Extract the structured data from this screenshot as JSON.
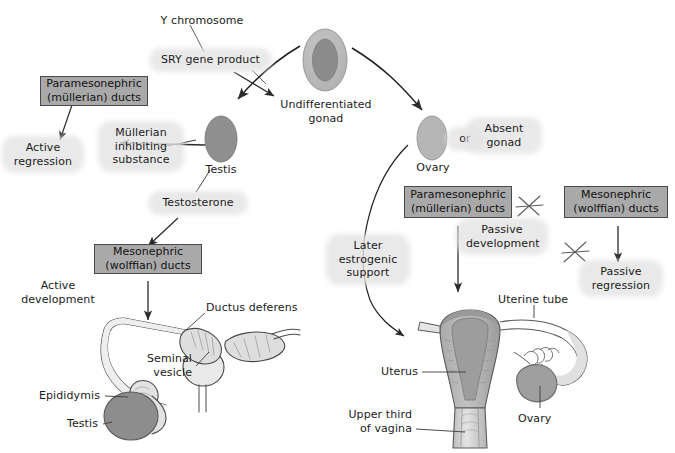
{
  "figure": {
    "background": "#ffffff",
    "width": 675,
    "height": 453
  },
  "colors": {
    "duct_box_fill": "#a9a9a9",
    "duct_box_border": "#4a4a4a",
    "label_halo": "#e4e4e4",
    "text": "#1b1b1b",
    "gonad_outer": "#b9b9b9",
    "gonad_inner": "#8a8a8a",
    "testis_fill": "#8f8f8f",
    "ovary_fill": "#b5b5b5",
    "arrow_stroke": "#2b2b2b",
    "anatomy_light": "#e8e8e8",
    "anatomy_mid": "#c9c9c9",
    "anatomy_dark": "#909090",
    "leader_line": "#3a3a3a"
  },
  "pathway": {
    "male": {
      "trigger": "Y chromosome",
      "signal": "SRY gene product",
      "gonad": "Testis",
      "hormones": [
        {
          "name": "Müllerian\ninhibiting\nsubstance",
          "effect": "Active\nregression",
          "target": "Paramesonephric\n(müllerian) ducts"
        },
        {
          "name": "Testosterone",
          "effect": "Active\ndevelopment",
          "target": "Mesonephric\n(wolffian) ducts"
        }
      ]
    },
    "common": {
      "gonad": "Undifferentiated\ngonad"
    },
    "female": {
      "gonad": "Ovary",
      "alternative_connector": "or",
      "alternative": "Absent\ngonad",
      "support": "Later\nestrogenic\nsupport",
      "outcomes": [
        {
          "target": "Paramesonephric\n(müllerian) ducts",
          "effect": "Passive\ndevelopment",
          "blocked": false
        },
        {
          "target": "Mesonephric\n(wolffian) ducts",
          "effect": "Passive\nregression",
          "blocked": true
        }
      ]
    }
  },
  "boxes": {
    "male_paramesonephric": "Paramesonephric\n(müllerian) ducts",
    "male_mesonephric": "Mesonephric\n(wolffian) ducts",
    "female_paramesonephric": "Paramesonephric\n(müllerian) ducts",
    "female_mesonephric": "Mesonephric\n(wolffian) ducts"
  },
  "labels": {
    "y_chromosome": "Y chromosome",
    "sry_gene_product": "SRY gene product",
    "undifferentiated_gonad": "Undifferentiated\ngonad",
    "mullerian_inhibiting_substance": "Müllerian\ninhibiting\nsubstance",
    "active_regression": "Active\nregression",
    "testis_node": "Testis",
    "testosterone": "Testosterone",
    "active_development": "Active\ndevelopment",
    "ovary_node": "Ovary",
    "or": "or",
    "absent_gonad": "Absent\ngonad",
    "later_estrogenic_support": "Later\nestrogenic\nsupport",
    "passive_development": "Passive\ndevelopment",
    "passive_regression": "Passive\nregression"
  },
  "anatomy": {
    "male": {
      "caption": "Male genital duct derivatives",
      "parts": [
        {
          "name": "Ductus deferens",
          "label": "Ductus deferens"
        },
        {
          "name": "Seminal vesicle",
          "label": "Seminal\nvesicle"
        },
        {
          "name": "Epididymis",
          "label": "Epididymis"
        },
        {
          "name": "Testis",
          "label": "Testis"
        }
      ]
    },
    "female": {
      "caption": "Female genital duct derivatives",
      "parts": [
        {
          "name": "Uterine tube",
          "label": "Uterine tube"
        },
        {
          "name": "Uterus",
          "label": "Uterus"
        },
        {
          "name": "Upper third of vagina",
          "label": "Upper third\nof vagina"
        },
        {
          "name": "Ovary",
          "label": "Ovary"
        }
      ]
    }
  }
}
